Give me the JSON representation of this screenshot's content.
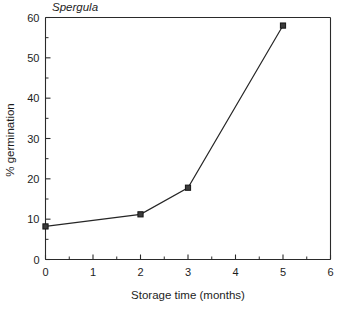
{
  "chart_data": {
    "type": "line",
    "title": "Spergula",
    "xlabel": "Storage time (months)",
    "ylabel": "% germination",
    "xlim": [
      0,
      6
    ],
    "ylim": [
      0,
      60
    ],
    "grid": false,
    "legend": null,
    "x": [
      0,
      2,
      3,
      5
    ],
    "values": [
      8.2,
      11.2,
      17.8,
      58
    ],
    "series": [
      {
        "name": "Spergula",
        "x": [
          0,
          2,
          3,
          5
        ],
        "values": [
          8.2,
          11.2,
          17.8,
          58
        ],
        "marker": "square",
        "color": "#262626"
      }
    ],
    "x_ticks": [
      0,
      1,
      2,
      3,
      4,
      5,
      6
    ],
    "x_tick_labels": [
      "0",
      "1",
      "2",
      "3",
      "4",
      "5",
      "6"
    ],
    "x_minor_step": 0.5,
    "y_ticks": [
      0,
      10,
      20,
      30,
      40,
      50,
      60
    ],
    "y_tick_labels": [
      "0",
      "10",
      "20",
      "30",
      "40",
      "50",
      "60"
    ],
    "y_minor_step": 5
  },
  "axes": {
    "title": "Spergula",
    "x_axis_title": "Storage time (months)",
    "y_axis_title": "% germination"
  },
  "colors": {
    "line": "#262626",
    "marker_fill": "#3b3b3b",
    "marker_edge": "#151515",
    "axis": "#2a2a2a",
    "background": "#ffffff",
    "text": "#1d1d1d"
  }
}
